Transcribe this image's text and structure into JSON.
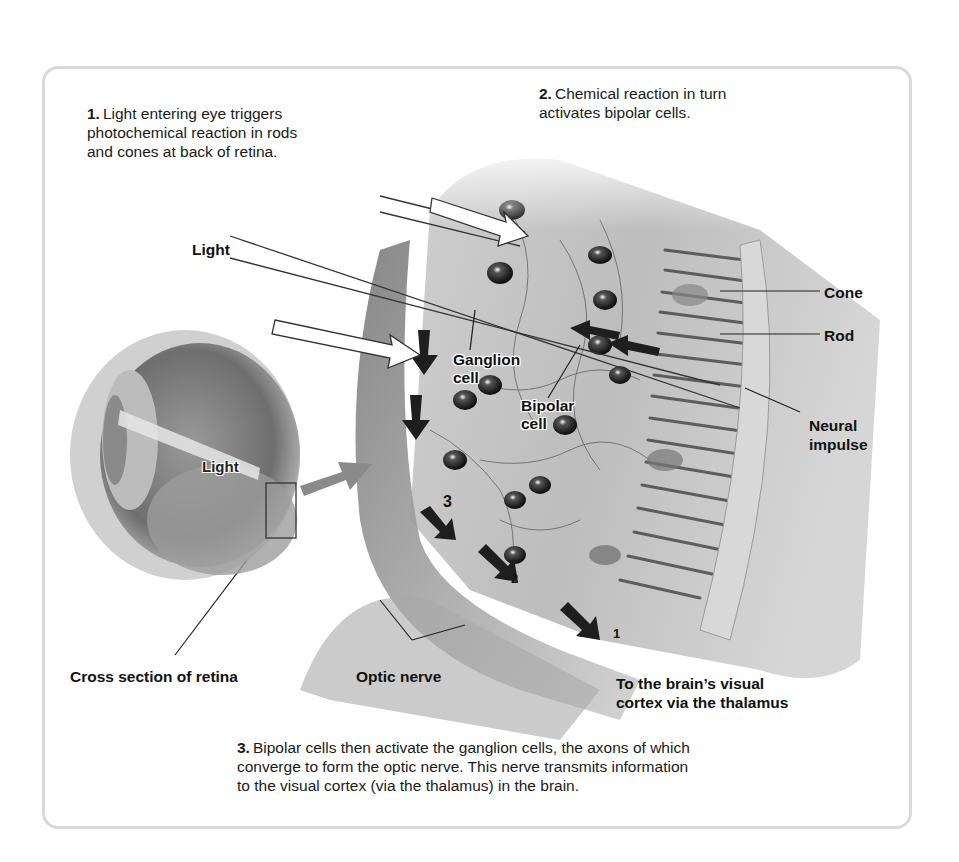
{
  "diagram": {
    "title_topic": "Visual transduction in the retina",
    "steps": [
      {
        "number": "1.",
        "lines": [
          "Light entering eye triggers",
          "photochemical reaction in rods",
          "and cones at back of retina."
        ]
      },
      {
        "number": "2.",
        "lines": [
          "Chemical reaction in turn",
          "activates bipolar cells."
        ]
      },
      {
        "number": "3.",
        "lines": [
          "Bipolar cells then activate the ganglion cells, the axons of which",
          "converge to form the optic nerve. This nerve transmits information",
          "to the visual cortex (via the thalamus) in the brain."
        ]
      }
    ],
    "labels": {
      "light_outer": "Light",
      "light_eye": "Light",
      "cone": "Cone",
      "rod": "Rod",
      "neural_impulse_1": "Neural",
      "neural_impulse_2": "impulse",
      "ganglion_1": "Ganglion",
      "ganglion_2": "cell",
      "bipolar_1": "Bipolar",
      "bipolar_2": "cell",
      "cross_section": "Cross section of retina",
      "optic_nerve": "Optic nerve",
      "brain_1": "To the brain’s visual",
      "brain_2": "cortex via the thalamus"
    },
    "layer_markers": {
      "one": "1",
      "two": "2",
      "three": "3"
    },
    "colors": {
      "frame": "#d9d9d9",
      "text": "#1a1a1a",
      "tissue": "#b8b8b8",
      "dark": "#2a2a2a"
    }
  }
}
